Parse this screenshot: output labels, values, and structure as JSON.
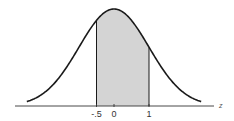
{
  "chart_data": {
    "type": "area",
    "title": "",
    "xlabel": "z",
    "ylabel": "",
    "distribution": {
      "name": "standard normal",
      "mean": 0,
      "sd": 1
    },
    "xlim": [
      -2.5,
      2.5
    ],
    "shaded_region": {
      "from": -0.5,
      "to": 1
    },
    "ticks": [
      {
        "value": -0.5,
        "label": "-.5"
      },
      {
        "value": 0,
        "label": "0"
      },
      {
        "value": 1,
        "label": "1"
      }
    ],
    "grid": false,
    "legend": null
  },
  "colors": {
    "curve": "#1a1a1a",
    "shade": "#d4d4d4",
    "axis": "#333333",
    "background": "#ffffff"
  },
  "axis": {
    "label": "z"
  }
}
